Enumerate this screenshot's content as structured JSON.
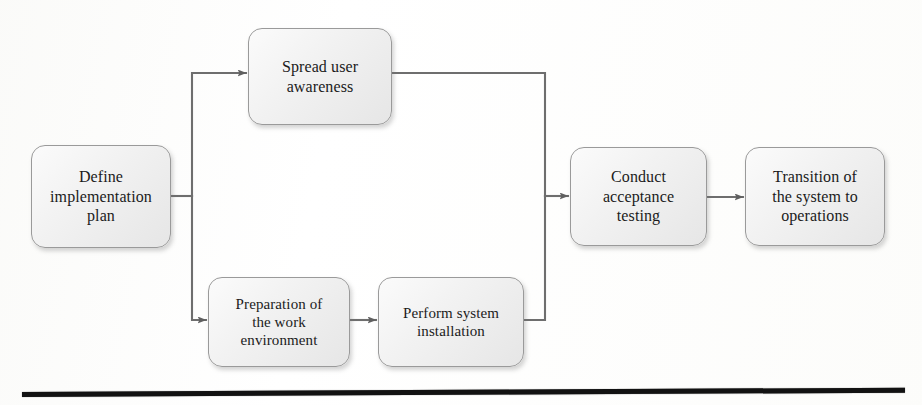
{
  "diagram": {
    "type": "flowchart",
    "orientation": "left-to-right",
    "background_color": "#ffffff",
    "node_fill_color": "#eeeeee",
    "node_border_color": "#9a9a9a",
    "connector_color": "#6e6e6e",
    "text_color": "#1b1b1b",
    "nodes": [
      {
        "id": "define-implementation-plan",
        "label": "Define\nimplementation\nplan",
        "x": 31,
        "y": 145,
        "width": 140,
        "height": 103,
        "font_size": 16
      },
      {
        "id": "spread-user-awareness",
        "label": "Spread user\nawareness",
        "x": 248,
        "y": 28,
        "width": 144,
        "height": 97,
        "font_size": 16
      },
      {
        "id": "preparation-of-the-work-environment",
        "label": "Preparation of\nthe work\nenvironment",
        "x": 208,
        "y": 277,
        "width": 142,
        "height": 90,
        "font_size": 15
      },
      {
        "id": "perform-system-installation",
        "label": "Perform system\ninstallation",
        "x": 378,
        "y": 277,
        "width": 146,
        "height": 90,
        "font_size": 15
      },
      {
        "id": "conduct-acceptance-testing",
        "label": "Conduct\nacceptance\ntesting",
        "x": 570,
        "y": 147,
        "width": 137,
        "height": 99,
        "font_size": 16
      },
      {
        "id": "transition-of-the-system-to-operations",
        "label": "Transition of\nthe system to\noperations",
        "x": 745,
        "y": 147,
        "width": 140,
        "height": 99,
        "font_size": 16
      }
    ],
    "connectors": [
      {
        "id": "plan-to-split",
        "from": "define-implementation-plan",
        "to": "split-point",
        "arrowhead": false,
        "points": "171,196 192,196"
      },
      {
        "id": "split-to-spread-user-awareness",
        "from": "define-implementation-plan",
        "to": "spread-user-awareness",
        "arrowhead": true,
        "points": "192,196 192,73 246,73"
      },
      {
        "id": "split-to-preparation",
        "from": "define-implementation-plan",
        "to": "preparation-of-the-work-environment",
        "arrowhead": true,
        "points": "192,196 192,320 206,320"
      },
      {
        "id": "preparation-to-perform-installation",
        "from": "preparation-of-the-work-environment",
        "to": "perform-system-installation",
        "arrowhead": true,
        "points": "350,320 376,320"
      },
      {
        "id": "spread-awareness-to-merge",
        "from": "spread-user-awareness",
        "to": "merge-point",
        "arrowhead": false,
        "points": "392,73 545,73 545,196"
      },
      {
        "id": "perform-installation-to-merge",
        "from": "perform-system-installation",
        "to": "merge-point",
        "arrowhead": false,
        "points": "524,320 545,320 545,196"
      },
      {
        "id": "merge-to-conduct-acceptance-testing",
        "from": "merge-point",
        "to": "conduct-acceptance-testing",
        "arrowhead": true,
        "points": "545,196 568,196"
      },
      {
        "id": "testing-to-transition",
        "from": "conduct-acceptance-testing",
        "to": "transition-of-the-system-to-operations",
        "arrowhead": true,
        "points": "707,197 743,197"
      }
    ],
    "footer_rule": {
      "x": 22,
      "y": 392,
      "width": 883,
      "thickness": 5,
      "rotation_deg": -0.28,
      "color": "#121212"
    }
  }
}
